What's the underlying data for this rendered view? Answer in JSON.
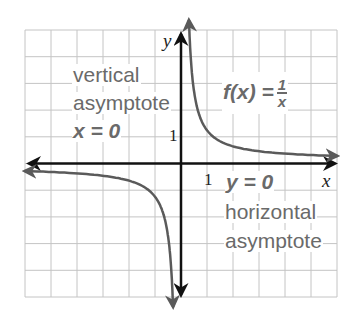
{
  "chart_data": {
    "type": "line",
    "title": "",
    "function": "f(x) = 1/x",
    "xlabel": "x",
    "ylabel": "y",
    "xlim": [
      -6,
      6
    ],
    "ylim": [
      -5,
      5
    ],
    "grid": true,
    "grid_cols": 12,
    "grid_rows": 10,
    "tick_labels": {
      "x": [
        "1"
      ],
      "y": [
        "1"
      ]
    },
    "series": [
      {
        "name": "f(x) = 1/x (x<0 branch)",
        "x": [
          -6,
          -4,
          -2,
          -1,
          -0.5,
          -0.25,
          -0.2
        ],
        "y": [
          -0.1667,
          -0.25,
          -0.5,
          -1,
          -2,
          -4,
          -5
        ]
      },
      {
        "name": "f(x) = 1/x (x>0 branch)",
        "x": [
          0.2,
          0.25,
          0.5,
          1,
          2,
          4,
          6
        ],
        "y": [
          5,
          4,
          2,
          1,
          0.5,
          0.25,
          0.1667
        ]
      }
    ],
    "annotations": [
      {
        "text": "vertical asymptote x = 0"
      },
      {
        "text": "horizontal asymptote y = 0"
      },
      {
        "text": "f(x) = 1/x"
      }
    ],
    "colors": {
      "curve": "#5a5a5a",
      "axes": "#111111",
      "grid": "#c4c4c4",
      "label_text": "#6a6a6a"
    }
  },
  "labels": {
    "axis_x": "x",
    "axis_y": "y",
    "tick_x_1": "1",
    "tick_y_1": "1",
    "vertical_line1": "vertical",
    "vertical_line2": "asymptote",
    "vertical_eq": "x = 0",
    "horizontal_eq": "y = 0",
    "horizontal_line1": "horizontal",
    "horizontal_line2": "asymptote",
    "func_lhs": "f(x) =",
    "func_num": "1",
    "func_den": "x"
  }
}
